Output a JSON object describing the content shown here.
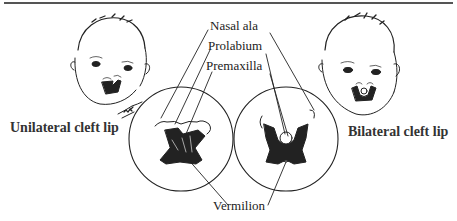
{
  "figure": {
    "labels": {
      "nasal_ala": "Nasal ala",
      "prolabium": "Prolabium",
      "premaxilla": "Premaxilla",
      "vermilion": "Vermilion",
      "unilateral": "Unilateral cleft lip",
      "bilateral": "Bilateral cleft lip"
    },
    "illustrations": {
      "left_face": "infant-face-unilateral-cleft",
      "right_face": "infant-face-bilateral-cleft",
      "left_detail": "magnified-lip-unilateral",
      "right_detail": "magnified-lip-bilateral"
    },
    "colors": {
      "ink": "#222222",
      "rule": "#555555",
      "background": "#ffffff"
    }
  }
}
